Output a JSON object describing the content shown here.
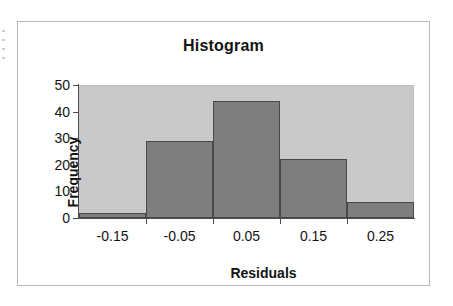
{
  "chart_data": {
    "type": "bar",
    "title": "Histogram",
    "xlabel": "Residuals",
    "ylabel": "Frequency",
    "categories": [
      "-0.15",
      "-0.05",
      "0.05",
      "0.15",
      "0.25"
    ],
    "values": [
      2,
      29,
      44,
      22,
      6
    ],
    "ylim": [
      0,
      50
    ],
    "y_ticks": [
      "0",
      "10",
      "20",
      "30",
      "40",
      "50"
    ],
    "y_tick_values": [
      0,
      10,
      20,
      30,
      40,
      50
    ],
    "x_tick_labels": [
      "-0.15",
      "-0.05",
      "0.05",
      "0.15",
      "0.25"
    ],
    "grid": false,
    "legend": false,
    "bin_edges": [
      -0.2,
      -0.1,
      0.0,
      0.1,
      0.2,
      0.3
    ],
    "colors": {
      "bar_fill": "#7e7e7e",
      "bar_border": "#494949",
      "plot_background": "#c9c9c9",
      "chart_background": "#ffffff",
      "axis": "#4c4c4c",
      "text": "#131313",
      "frame_border": "#b9b9b9"
    }
  }
}
